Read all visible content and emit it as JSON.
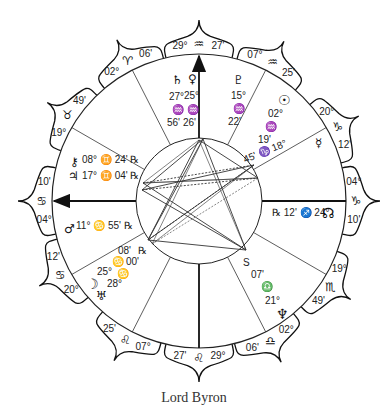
{
  "title": "Lord Byron",
  "chart": {
    "center": [
      199,
      201
    ],
    "outer_radius": 147,
    "inner_radius": 63,
    "stroke": "#222222",
    "aspect_color": "#333333"
  },
  "axes": [
    {
      "name": "mc",
      "angle": 90,
      "arrow": true,
      "label": "29° ♒ 27'"
    },
    {
      "name": "asc",
      "angle": 180,
      "arrow": true,
      "label": "04° ♋ 10'"
    },
    {
      "name": "ic",
      "angle": 270,
      "arrow": false,
      "label": "29° ♌ 27'"
    },
    {
      "name": "dsc",
      "angle": 0,
      "arrow": false,
      "label": "04° ♑ 10'"
    }
  ],
  "cusp_lines": [
    117,
    150,
    210,
    243,
    297,
    330,
    30,
    63
  ],
  "cusps": [
    {
      "id": "c10",
      "angle": 90,
      "deg": "29°",
      "sign": "♒",
      "min": "27'"
    },
    {
      "id": "c11",
      "angle": 62,
      "deg": "07°",
      "sign": "♒",
      "min": "25'"
    },
    {
      "id": "c12",
      "angle": 28,
      "deg": "20°",
      "sign": "♑",
      "min": "12'"
    },
    {
      "id": "c1",
      "angle": 0,
      "deg": "04°",
      "sign": "♑",
      "min": "10'"
    },
    {
      "id": "c2",
      "angle": -33,
      "deg": "19°",
      "sign": "♏",
      "min": "49'"
    },
    {
      "id": "c3",
      "angle": -63,
      "deg": "02°",
      "sign": "♎",
      "min": "06'"
    },
    {
      "id": "c4",
      "angle": -90,
      "deg": "29°",
      "sign": "♌",
      "min": "27'"
    },
    {
      "id": "c5",
      "angle": -118,
      "deg": "07°",
      "sign": "♌",
      "min": "25'"
    },
    {
      "id": "c6",
      "angle": -152,
      "deg": "20°",
      "sign": "♋",
      "min": "12'"
    },
    {
      "id": "c7",
      "angle": 180,
      "deg": "04°",
      "sign": "♋",
      "min": "10'"
    },
    {
      "id": "c8",
      "angle": 147,
      "deg": "19°",
      "sign": "♉",
      "min": "49'"
    },
    {
      "id": "c9",
      "angle": 117,
      "deg": "02°",
      "sign": "♈",
      "min": "06'"
    }
  ],
  "planets": [
    {
      "name": "saturn",
      "glyph": "♄",
      "deg": "27°",
      "sign": "♒",
      "min": "56'",
      "x": 175,
      "y": 84
    },
    {
      "name": "venus",
      "glyph": "♀",
      "deg": "25°",
      "sign": "♒",
      "min": "26'",
      "x": 193,
      "y": 84
    },
    {
      "name": "pluto",
      "glyph": "♇",
      "deg": "15°",
      "sign": "♒",
      "min": "22'",
      "x": 234,
      "y": 88
    },
    {
      "name": "sun",
      "glyph": "☉",
      "deg": "02°",
      "sign": "♒",
      "min": "19'",
      "x": 287,
      "y": 119
    },
    {
      "name": "mercury",
      "glyph": "☿",
      "deg": "18°",
      "sign": "♑",
      "min": "45'"
    },
    {
      "name": "north-node",
      "glyph": "☊",
      "deg": "24°",
      "sign": "♐",
      "min": "12'",
      "retro": "℞"
    },
    {
      "name": "neptune",
      "glyph": "♆",
      "deg": "21°",
      "sign": "♎",
      "min": "07'",
      "station": "S"
    },
    {
      "name": "moon",
      "glyph": "☽",
      "deg": "25°",
      "sign": "♋",
      "min": "08'",
      "retro": "℞"
    },
    {
      "name": "uranus",
      "glyph": "♅",
      "deg": "28°",
      "sign": "♋",
      "min": "00'"
    },
    {
      "name": "mars",
      "glyph": "♂",
      "deg": "11°",
      "sign": "♋",
      "min": "55'",
      "retro": "℞"
    },
    {
      "name": "chiron",
      "glyph": "⚷",
      "deg": "08°",
      "sign": "♊",
      "min": "24'",
      "retro": "℞"
    },
    {
      "name": "jupiter",
      "glyph": "♃",
      "deg": "17°",
      "sign": "♊",
      "min": "04'",
      "retro": "℞"
    }
  ],
  "labels": {
    "saturn_deg": "27°",
    "saturn_sign": "♒",
    "saturn_min": "56'",
    "venus_deg": "25°",
    "venus_sign": "♒",
    "venus_min": "26'",
    "pluto_deg": "15°",
    "pluto_sign": "♒",
    "pluto_min": "22'",
    "sun_deg": "02°",
    "sun_sign": "♒",
    "sun_min": "19'",
    "mercury_line": "45' ♑ 18°",
    "node_line": "℞ 12' ♐ 24°",
    "neptune_s": "S",
    "neptune_min": "07'",
    "neptune_sign": "♎",
    "neptune_deg": "21°",
    "mars_line": "11° ♋ 55' ℞",
    "chiron_line": "08° ♊ 24' ℞",
    "jupiter_line": "17° ♊ 04' ℞",
    "moon_deg": "25°",
    "moon_sign": "♋",
    "moon_min": "08'",
    "moon_r": "℞",
    "uranus_deg": "28°",
    "uranus_sign": "♋",
    "uranus_min": "00'"
  },
  "aspect_points": [
    [
      199,
      140
    ],
    [
      203,
      139
    ],
    [
      143,
      183
    ],
    [
      142,
      190
    ],
    [
      148,
      240
    ],
    [
      152,
      244
    ],
    [
      246,
      250
    ],
    [
      254,
      165
    ],
    [
      258,
      178
    ]
  ],
  "aspect_lines": [
    [
      0,
      6
    ],
    [
      1,
      6
    ],
    [
      0,
      4
    ],
    [
      1,
      5
    ],
    [
      2,
      7
    ],
    [
      3,
      7
    ],
    [
      2,
      8
    ],
    [
      3,
      6
    ],
    [
      4,
      7
    ],
    [
      5,
      8
    ],
    [
      4,
      6
    ],
    [
      2,
      6
    ],
    [
      0,
      2
    ],
    [
      1,
      3
    ],
    [
      7,
      4
    ],
    [
      8,
      2
    ],
    [
      0,
      8
    ],
    [
      4,
      1
    ],
    [
      5,
      7
    ],
    [
      3,
      8
    ]
  ]
}
